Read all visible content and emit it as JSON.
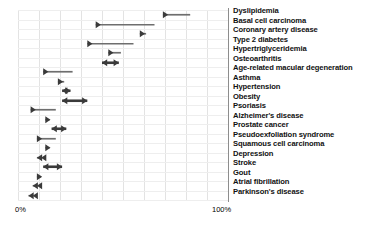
{
  "chart_data": {
    "type": "bar",
    "title": "",
    "subtitle": "",
    "xlabel": "",
    "ylabel": "",
    "xlim": [
      0,
      100
    ],
    "xticks": [
      0,
      100
    ],
    "xtick_labels": [
      "0%",
      "100%"
    ],
    "grid": true,
    "legend": null,
    "unit": "%",
    "orientation": "horizontal",
    "categories": [
      "Dyslipidemia",
      "Basal cell carcinoma",
      "Coronary artery disease",
      "Type 2 diabetes",
      "Hypertriglyceridemia",
      "Osteoarthritis",
      "Age-related macular degeneration",
      "Asthma",
      "Hypertension",
      "Obesity",
      "Psoriasis",
      "Alzheimer's  disease",
      "Prostate cancer",
      "Pseudoexfoliation syndrome",
      "Squamous cell carcinoma",
      "Depression",
      "Stroke",
      "Gout",
      "Atrial fibrillation",
      "Parkinson's disease"
    ],
    "series": [
      {
        "name": "range",
        "points": [
          {
            "category": "Dyslipidemia",
            "start": 69,
            "end": 82,
            "direction": "right"
          },
          {
            "category": "Basal cell carcinoma",
            "start": 37,
            "end": 65,
            "direction": "right"
          },
          {
            "category": "Coronary artery disease",
            "start": 58,
            "end": 61,
            "direction": "right"
          },
          {
            "category": "Type 2 diabetes",
            "start": 33,
            "end": 55,
            "direction": "right"
          },
          {
            "category": "Hypertriglyceridemia",
            "start": 43,
            "end": 49,
            "direction": "right"
          },
          {
            "category": "Osteoarthritis",
            "start": 40,
            "end": 48,
            "direction": "both"
          },
          {
            "category": "Age-related macular degeneration",
            "start": 12,
            "end": 26,
            "direction": "right"
          },
          {
            "category": "Asthma",
            "start": 19,
            "end": 22,
            "direction": "right"
          },
          {
            "category": "Hypertension",
            "start": 21,
            "end": 25,
            "direction": "both"
          },
          {
            "category": "Obesity",
            "start": 21,
            "end": 33,
            "direction": "both"
          },
          {
            "category": "Psoriasis",
            "start": 6,
            "end": 18,
            "direction": "right"
          },
          {
            "category": "Alzheimer's  disease",
            "start": 13,
            "end": 15,
            "direction": "right"
          },
          {
            "category": "Prostate cancer",
            "start": 16,
            "end": 23,
            "direction": "both"
          },
          {
            "category": "Pseudoexfoliation syndrome",
            "start": 9,
            "end": 18,
            "direction": "right"
          },
          {
            "category": "Squamous cell carcinoma",
            "start": 13,
            "end": 15,
            "direction": "right"
          },
          {
            "category": "Depression",
            "start": 9,
            "end": 11,
            "direction": "left"
          },
          {
            "category": "Stroke",
            "start": 12,
            "end": 21,
            "direction": "both"
          },
          {
            "category": "Gout",
            "start": 9,
            "end": 11,
            "direction": "right"
          },
          {
            "category": "Atrial fibrillation",
            "start": 7,
            "end": 9,
            "direction": "left"
          },
          {
            "category": "Parkinson's disease",
            "start": 5,
            "end": 7,
            "direction": "left"
          }
        ]
      }
    ],
    "colors": {
      "marker": "#3a3a3a",
      "marker_light": "#6e6e6e",
      "grid": "#e3e3e3",
      "axis": "#8d8d8d",
      "text": "#111111"
    }
  },
  "axis": {
    "left_tick_label": "0%",
    "right_tick_label": "100%"
  }
}
